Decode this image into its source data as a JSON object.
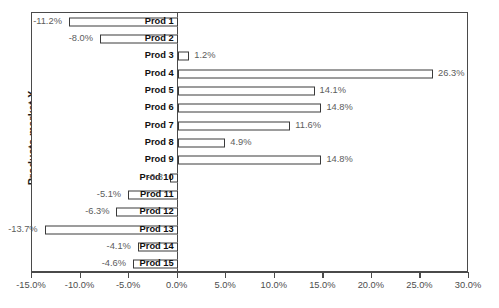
{
  "chart_data": {
    "type": "bar",
    "orientation": "horizontal",
    "title": "",
    "xlabel": "",
    "ylabel": "Products market X",
    "xlim": [
      -15.0,
      30.0
    ],
    "grid": false,
    "legend": false,
    "tick_labels": [
      "-15.0%",
      "-10.0%",
      "-5.0%",
      "0.0%",
      "5.0%",
      "10.0%",
      "15.0%",
      "20.0%",
      "25.0%",
      "30.0%"
    ],
    "tick_values": [
      -15.0,
      -10.0,
      -5.0,
      0.0,
      5.0,
      10.0,
      15.0,
      20.0,
      25.0,
      30.0
    ],
    "categories": [
      "Prod 1",
      "Prod 2",
      "Prod 3",
      "Prod 4",
      "Prod 5",
      "Prod 6",
      "Prod 7",
      "Prod 8",
      "Prod 9",
      "Prod 10",
      "Prod 11",
      "Prod 12",
      "Prod 13",
      "Prod 14",
      "Prod 15"
    ],
    "values": [
      -11.2,
      -8.0,
      1.2,
      26.3,
      14.1,
      14.8,
      11.6,
      4.9,
      14.8,
      -0.8,
      -5.1,
      -6.3,
      -13.7,
      -4.1,
      -4.6
    ],
    "data_labels": [
      "-11.2%",
      "-8.0%",
      "1.2%",
      "26.3%",
      "14.1%",
      "14.8%",
      "11.6%",
      "4.9%",
      "14.8%",
      "-0.8",
      "-5.1%",
      "-6.3%",
      "-13.7%",
      "-4.1%",
      "-4.6%"
    ],
    "bar_face_color": "#ffffff",
    "bar_edge_color": "#3a3a3a",
    "axis_color": "#4a4a4a",
    "label_color": "#101010",
    "value_label_color": "#5c5c5c"
  }
}
